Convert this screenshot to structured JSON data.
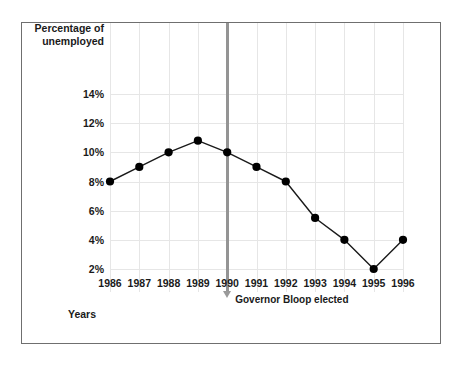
{
  "figure": {
    "y_axis_title_line1": "Percentage of",
    "y_axis_title_line2": "unemployed",
    "x_axis_title": "Years",
    "annotation_label": "Governor Bloop elected",
    "annotation_year": "1990",
    "colors": {
      "frame": "#6f6f6f",
      "grid": "#e6e6e6",
      "series_line": "#1a1a1a",
      "marker_point": "#000000",
      "event_line": "#949494",
      "arrow": "#9a9a9a",
      "text": "#1a1a1a",
      "background": "#ffffff"
    }
  },
  "chart_data": {
    "type": "line",
    "title": "",
    "subtitle": "",
    "xlabel": "Years",
    "ylabel": "Percentage of unemployed",
    "x": [
      1986,
      1987,
      1988,
      1989,
      1990,
      1991,
      1992,
      1993,
      1994,
      1995,
      1996
    ],
    "x_tick_labels": [
      "1986",
      "1987",
      "1988",
      "1989",
      "1990",
      "1991",
      "1992",
      "1993",
      "1994",
      "1995",
      "1996"
    ],
    "values": [
      8,
      9,
      10,
      10.8,
      10,
      9,
      8,
      5.5,
      4,
      2,
      4
    ],
    "y_tick_labels": [
      "14%",
      "12%",
      "10%",
      "8%",
      "6%",
      "4%",
      "2%"
    ],
    "y_ticks": [
      14,
      12,
      10,
      8,
      6,
      4,
      2
    ],
    "ylim": [
      0,
      15.4
    ],
    "xlim": [
      1986,
      1996
    ],
    "grid": true,
    "legend": "none",
    "annotations": [
      {
        "x": 1990,
        "text": "Governor Bloop elected",
        "style": "vertical-line-with-down-arrow"
      }
    ]
  }
}
